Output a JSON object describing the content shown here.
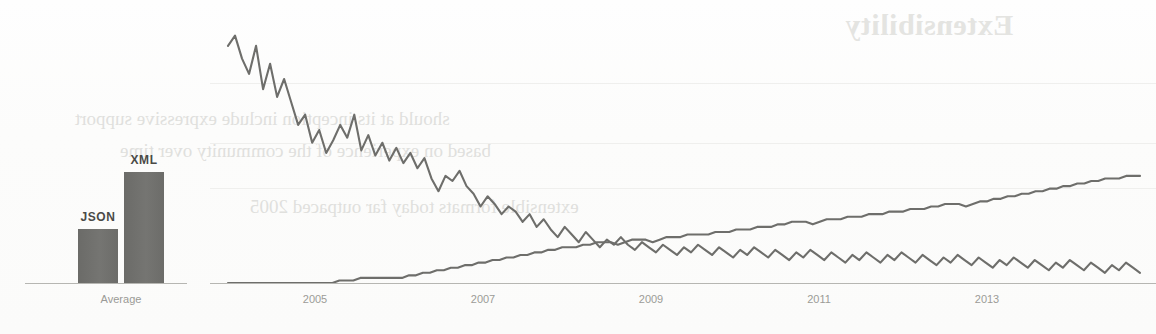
{
  "page": {
    "background_color": "#fdfdfc",
    "ink_color": "#6e6e6b",
    "bleed_color": "#dededb"
  },
  "bleedthrough": {
    "note": "mirrored ink show-through from reverse side of printed page",
    "heading": "Extensibility",
    "lines": [
      "should at its inception include expressive support",
      "based on experience of the community over time",
      "extensible formats today far outpaced 2005"
    ]
  },
  "chart_data": [
    {
      "id": "average-bar-chart",
      "type": "bar",
      "title": "",
      "xlabel": "",
      "ylabel": "",
      "categories": [
        "Average"
      ],
      "group_labels": [
        "JSON",
        "XML"
      ],
      "series": [
        {
          "name": "JSON",
          "values": [
            49
          ]
        },
        {
          "name": "XML",
          "values": [
            100
          ]
        }
      ],
      "values": [
        49,
        100
      ],
      "ylim": [
        0,
        115
      ],
      "grid": false,
      "legend": "none",
      "bar_color": "#6f6f6c",
      "axis_label": "Average"
    },
    {
      "id": "trend-line-chart",
      "type": "line",
      "title": "",
      "xlabel": "",
      "ylabel": "",
      "xticks": [
        "2005",
        "2007",
        "2009",
        "2011",
        "2013"
      ],
      "xlim": [
        "2004",
        "2014.6"
      ],
      "ylim": [
        0,
        100
      ],
      "grid": true,
      "grid_lines": 3,
      "legend": "none",
      "series": [
        {
          "name": "XML",
          "color": "#6e6e6b",
          "trend": "declining",
          "start_value": 97,
          "end_value": 15,
          "values": [
            93,
            97,
            88,
            82,
            93,
            76,
            86,
            73,
            80,
            71,
            62,
            66,
            55,
            60,
            51,
            56,
            62,
            57,
            66,
            52,
            58,
            50,
            55,
            48,
            53,
            47,
            51,
            45,
            49,
            41,
            36,
            42,
            40,
            44,
            38,
            35,
            30,
            34,
            31,
            27,
            30,
            28,
            24,
            27,
            22,
            25,
            21,
            18,
            22,
            19,
            16,
            20,
            17,
            14,
            17,
            15,
            18,
            15,
            13,
            16,
            14,
            12,
            15,
            13,
            11,
            14,
            12,
            15,
            13,
            11,
            14,
            12,
            10,
            13,
            11,
            14,
            12,
            10,
            13,
            11,
            9,
            12,
            10,
            13,
            11,
            9,
            12,
            10,
            8,
            11,
            9,
            12,
            10,
            8,
            11,
            9,
            12,
            10,
            8,
            11,
            9,
            7,
            10,
            8,
            11,
            9,
            7,
            10,
            8,
            6,
            9,
            7,
            10,
            8,
            6,
            9,
            7,
            5,
            8,
            6,
            9,
            7,
            5,
            8,
            6,
            4,
            7,
            5,
            8,
            6,
            4
          ]
        },
        {
          "name": "JSON",
          "color": "#6e6e6b",
          "trend": "rising",
          "start_value": 0,
          "end_value": 42,
          "values": [
            0,
            0,
            0,
            0,
            0,
            0,
            0,
            0,
            0,
            0,
            0,
            0,
            0,
            0,
            0,
            0,
            1,
            1,
            1,
            2,
            2,
            2,
            2,
            2,
            2,
            2,
            3,
            3,
            4,
            4,
            5,
            5,
            6,
            6,
            7,
            7,
            8,
            8,
            9,
            9,
            10,
            10,
            11,
            11,
            12,
            12,
            13,
            13,
            14,
            14,
            14,
            15,
            15,
            16,
            16,
            16,
            15,
            16,
            17,
            17,
            17,
            16,
            17,
            18,
            18,
            18,
            19,
            19,
            19,
            19,
            20,
            20,
            20,
            21,
            21,
            21,
            22,
            22,
            22,
            23,
            23,
            24,
            24,
            24,
            23,
            24,
            25,
            25,
            25,
            26,
            26,
            26,
            27,
            27,
            27,
            28,
            28,
            28,
            29,
            29,
            29,
            30,
            30,
            31,
            31,
            31,
            30,
            31,
            32,
            32,
            33,
            33,
            34,
            34,
            35,
            35,
            36,
            36,
            37,
            37,
            38,
            38,
            39,
            39,
            40,
            40,
            41,
            41,
            41,
            42,
            42,
            42
          ]
        }
      ],
      "crossover": {
        "approx_year": "2011.5",
        "note": "JSON overtakes XML"
      }
    }
  ]
}
